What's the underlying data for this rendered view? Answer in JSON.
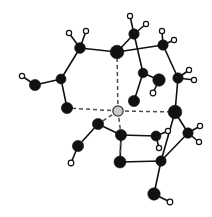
{
  "figure": {
    "width": 212,
    "height": 217,
    "background_color": "#ffffff"
  },
  "style": {
    "bond_color": "#111111",
    "bond_width": 1.6,
    "dashed_color": "#4d4d4d",
    "dashed_width": 1.5,
    "dash_pattern": "4,3",
    "dark_atom_fill": "#111111",
    "dark_atom_stroke": "#111111",
    "hub_atom_fill": "#c9c9c9",
    "hub_atom_stroke": "#333333",
    "hollow_atom_fill": "#ffffff",
    "hollow_atom_stroke": "#111111",
    "hollow_atom_stroke_width": 1.2
  },
  "legend": {
    "dark_atom_label": "heavy atom (dark sphere)",
    "hub_atom_label": "central hub atom (light sphere)",
    "hollow_atom_label": "hydrogen atom (hollow sphere)",
    "solid_bond_label": "covalent bond",
    "dashed_bond_label": "coordination / hydrogen bond"
  },
  "atoms": [
    {
      "id": "hub",
      "x": 118,
      "y": 111,
      "r": 5.2,
      "kind": "hub",
      "label": "central-hub-atom"
    },
    {
      "id": "d1",
      "x": 117,
      "y": 52,
      "r": 6.8,
      "kind": "dark",
      "label": "top-center-large-atom"
    },
    {
      "id": "d2",
      "x": 175,
      "y": 112,
      "r": 6.8,
      "kind": "dark",
      "label": "right-middle-large-atom"
    },
    {
      "id": "d3",
      "x": 67,
      "y": 108,
      "r": 5.6,
      "kind": "dark",
      "label": "left-middle-atom"
    },
    {
      "id": "d4",
      "x": 121,
      "y": 135,
      "r": 5.6,
      "kind": "dark",
      "label": "bottom-center-atom"
    },
    {
      "id": "d5",
      "x": 80,
      "y": 48,
      "r": 5.4,
      "kind": "dark",
      "label": "upper-left-atom"
    },
    {
      "id": "d6",
      "x": 61,
      "y": 79,
      "r": 5.0,
      "kind": "dark",
      "label": "left-upper-branch-atom"
    },
    {
      "id": "d7",
      "x": 35,
      "y": 85,
      "r": 5.6,
      "kind": "dark",
      "label": "far-left-atom"
    },
    {
      "id": "d8",
      "x": 134,
      "y": 34,
      "r": 5.2,
      "kind": "dark",
      "label": "top-methyl-carbon"
    },
    {
      "id": "d9",
      "x": 163,
      "y": 45,
      "r": 5.2,
      "kind": "dark",
      "label": "upper-right-atom"
    },
    {
      "id": "d10",
      "x": 178,
      "y": 78,
      "r": 5.2,
      "kind": "dark",
      "label": "right-upper-atom"
    },
    {
      "id": "d11",
      "x": 143,
      "y": 73,
      "r": 4.8,
      "kind": "dark",
      "label": "inner-right-atom"
    },
    {
      "id": "d12",
      "x": 159,
      "y": 80,
      "r": 6.2,
      "kind": "dark",
      "label": "inner-right-large-atom"
    },
    {
      "id": "d13",
      "x": 134,
      "y": 101,
      "r": 5.6,
      "kind": "dark",
      "label": "inner-lower-right-atom"
    },
    {
      "id": "d14",
      "x": 98,
      "y": 124,
      "r": 5.6,
      "kind": "dark",
      "label": "inner-lower-left-atom"
    },
    {
      "id": "d15",
      "x": 78,
      "y": 146,
      "r": 5.6,
      "kind": "dark",
      "label": "lower-left-atom"
    },
    {
      "id": "d16",
      "x": 156,
      "y": 136,
      "r": 5.0,
      "kind": "dark",
      "label": "lower-right-atom"
    },
    {
      "id": "d17",
      "x": 188,
      "y": 133,
      "r": 5.2,
      "kind": "dark",
      "label": "far-lower-right-atom"
    },
    {
      "id": "d18",
      "x": 120,
      "y": 162,
      "r": 6.0,
      "kind": "dark",
      "label": "bottom-atom"
    },
    {
      "id": "d19",
      "x": 161,
      "y": 161,
      "r": 5.2,
      "kind": "dark",
      "label": "bottom-right-atom"
    },
    {
      "id": "d20",
      "x": 154,
      "y": 194,
      "r": 6.2,
      "kind": "dark",
      "label": "bottom-right-terminal-atom"
    },
    {
      "id": "h1",
      "x": 69,
      "y": 33,
      "r": 2.6,
      "kind": "hollow",
      "label": "hydrogen-upper-left-a"
    },
    {
      "id": "h2",
      "x": 86,
      "y": 31,
      "r": 2.6,
      "kind": "hollow",
      "label": "hydrogen-upper-left-b"
    },
    {
      "id": "h3",
      "x": 22,
      "y": 76,
      "r": 2.6,
      "kind": "hollow",
      "label": "hydrogen-far-left"
    },
    {
      "id": "h4",
      "x": 130,
      "y": 16,
      "r": 2.6,
      "kind": "hollow",
      "label": "hydrogen-top-a"
    },
    {
      "id": "h5",
      "x": 146,
      "y": 24,
      "r": 2.6,
      "kind": "hollow",
      "label": "hydrogen-top-b"
    },
    {
      "id": "h6",
      "x": 162,
      "y": 31,
      "r": 2.6,
      "kind": "hollow",
      "label": "hydrogen-upper-right-a"
    },
    {
      "id": "h7",
      "x": 174,
      "y": 40,
      "r": 2.6,
      "kind": "hollow",
      "label": "hydrogen-upper-right-b"
    },
    {
      "id": "h8",
      "x": 189,
      "y": 70,
      "r": 2.6,
      "kind": "hollow",
      "label": "hydrogen-right-a"
    },
    {
      "id": "h9",
      "x": 194,
      "y": 80,
      "r": 2.6,
      "kind": "hollow",
      "label": "hydrogen-right-b"
    },
    {
      "id": "h10",
      "x": 153,
      "y": 93,
      "r": 2.8,
      "kind": "hollow",
      "label": "hydrogen-inner-right"
    },
    {
      "id": "h11",
      "x": 71,
      "y": 163,
      "r": 2.8,
      "kind": "hollow",
      "label": "hydrogen-lower-left"
    },
    {
      "id": "h12",
      "x": 168,
      "y": 131,
      "r": 2.6,
      "kind": "hollow",
      "label": "hydrogen-lower-right-a"
    },
    {
      "id": "h13",
      "x": 159,
      "y": 148,
      "r": 2.6,
      "kind": "hollow",
      "label": "hydrogen-lower-right-b"
    },
    {
      "id": "h14",
      "x": 200,
      "y": 126,
      "r": 2.6,
      "kind": "hollow",
      "label": "hydrogen-far-right-a"
    },
    {
      "id": "h15",
      "x": 199,
      "y": 142,
      "r": 2.6,
      "kind": "hollow",
      "label": "hydrogen-far-right-b"
    },
    {
      "id": "h16",
      "x": 170,
      "y": 202,
      "r": 2.8,
      "kind": "hollow",
      "label": "hydrogen-bottom-right"
    }
  ],
  "bonds": [
    {
      "from": "d5",
      "to": "h1",
      "type": "solid"
    },
    {
      "from": "d5",
      "to": "h2",
      "type": "solid"
    },
    {
      "from": "d5",
      "to": "d1",
      "type": "solid"
    },
    {
      "from": "d5",
      "to": "d6",
      "type": "solid"
    },
    {
      "from": "d6",
      "to": "d7",
      "type": "solid"
    },
    {
      "from": "d7",
      "to": "h3",
      "type": "solid"
    },
    {
      "from": "d6",
      "to": "d3",
      "type": "solid"
    },
    {
      "from": "d1",
      "to": "d8",
      "type": "solid"
    },
    {
      "from": "d8",
      "to": "h4",
      "type": "solid"
    },
    {
      "from": "d8",
      "to": "h5",
      "type": "solid"
    },
    {
      "from": "d1",
      "to": "d9",
      "type": "solid"
    },
    {
      "from": "d9",
      "to": "h6",
      "type": "solid"
    },
    {
      "from": "d9",
      "to": "h7",
      "type": "solid"
    },
    {
      "from": "d9",
      "to": "d10",
      "type": "solid"
    },
    {
      "from": "d10",
      "to": "h8",
      "type": "solid"
    },
    {
      "from": "d10",
      "to": "h9",
      "type": "solid"
    },
    {
      "from": "d10",
      "to": "d2",
      "type": "solid"
    },
    {
      "from": "d8",
      "to": "d11",
      "type": "solid"
    },
    {
      "from": "d11",
      "to": "d12",
      "type": "solid"
    },
    {
      "from": "d12",
      "to": "h10",
      "type": "solid"
    },
    {
      "from": "d11",
      "to": "d13",
      "type": "solid"
    },
    {
      "from": "d4",
      "to": "d14",
      "type": "solid"
    },
    {
      "from": "d14",
      "to": "d15",
      "type": "solid"
    },
    {
      "from": "d15",
      "to": "h11",
      "type": "solid"
    },
    {
      "from": "d4",
      "to": "d16",
      "type": "solid"
    },
    {
      "from": "d16",
      "to": "h12",
      "type": "solid"
    },
    {
      "from": "d16",
      "to": "h13",
      "type": "solid"
    },
    {
      "from": "d2",
      "to": "d17",
      "type": "solid"
    },
    {
      "from": "d17",
      "to": "h14",
      "type": "solid"
    },
    {
      "from": "d17",
      "to": "h15",
      "type": "solid"
    },
    {
      "from": "d2",
      "to": "d19",
      "type": "solid"
    },
    {
      "from": "d17",
      "to": "d19",
      "type": "solid"
    },
    {
      "from": "d4",
      "to": "d18",
      "type": "solid"
    },
    {
      "from": "d18",
      "to": "d19",
      "type": "solid"
    },
    {
      "from": "d19",
      "to": "d20",
      "type": "solid"
    },
    {
      "from": "d20",
      "to": "h16",
      "type": "solid"
    },
    {
      "from": "hub",
      "to": "d1",
      "type": "dashed"
    },
    {
      "from": "hub",
      "to": "d2",
      "type": "dashed"
    },
    {
      "from": "hub",
      "to": "d3",
      "type": "dashed"
    },
    {
      "from": "hub",
      "to": "d4",
      "type": "dashed"
    },
    {
      "from": "hub",
      "to": "d14",
      "type": "dashed"
    },
    {
      "from": "d4",
      "to": "d18",
      "type": "dashed"
    }
  ]
}
